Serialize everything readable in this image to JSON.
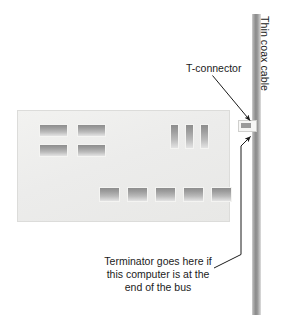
{
  "diagram": {
    "title_visible": false,
    "background_color": "#ffffff",
    "line_color": "#1b1b1b",
    "cable_color": "#8a8a8a",
    "board_color": "#ececea",
    "chip_color": "#9e9e9e"
  },
  "labels": {
    "t_connector": "T-connector",
    "thin_coax_cable": "Thin coax cable",
    "terminator_line1": "Terminator goes here if",
    "terminator_line2": "this computer is at the",
    "terminator_line3": "end of the bus",
    "terminator_full": "Terminator goes here if this computer is at the end of the bus"
  },
  "parts": {
    "adapter_card": "network adapter card",
    "cable": "thin coax cable segment",
    "connector": "BNC T-connector"
  },
  "chips": {
    "left_grid": [
      {
        "name": "chip-left-1",
        "x": 21,
        "y": 13,
        "w": 29,
        "h": 13
      },
      {
        "name": "chip-left-2",
        "x": 59,
        "y": 13,
        "w": 29,
        "h": 13
      },
      {
        "name": "chip-left-3",
        "x": 21,
        "y": 33,
        "w": 29,
        "h": 13
      },
      {
        "name": "chip-left-4",
        "x": 59,
        "y": 33,
        "w": 29,
        "h": 13
      }
    ],
    "right_vertical": [
      {
        "name": "chip-right-1",
        "x": 152,
        "y": 13,
        "w": 9,
        "h": 25
      },
      {
        "name": "chip-right-2",
        "x": 167,
        "y": 13,
        "w": 9,
        "h": 25
      },
      {
        "name": "chip-right-3",
        "x": 182,
        "y": 13,
        "w": 9,
        "h": 25
      }
    ],
    "bottom_row": [
      {
        "name": "chip-bottom-1",
        "x": 81,
        "y": 76,
        "w": 21,
        "h": 15
      },
      {
        "name": "chip-bottom-2",
        "x": 109,
        "y": 76,
        "w": 21,
        "h": 15
      },
      {
        "name": "chip-bottom-3",
        "x": 137,
        "y": 76,
        "w": 21,
        "h": 15
      },
      {
        "name": "chip-bottom-4",
        "x": 165,
        "y": 76,
        "w": 21,
        "h": 15
      },
      {
        "name": "chip-bottom-5",
        "x": 193,
        "y": 76,
        "w": 21,
        "h": 15
      }
    ]
  }
}
